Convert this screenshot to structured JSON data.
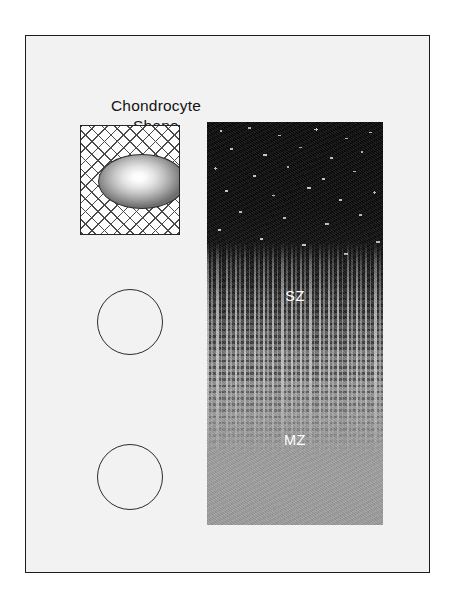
{
  "figure": {
    "columns": {
      "left_title_line1": "Chondrocyte",
      "left_title_line2": "Shape",
      "right_title": "Control"
    },
    "chondrocyte_shapes": [
      {
        "name": "superficial-flattened-cell",
        "geometry": "ellipse",
        "matrix_background": "cross-hatch",
        "fill": "radial-gradient-white-to-gray"
      },
      {
        "name": "middle-zone-round-cell",
        "geometry": "sphere",
        "matrix_background": "none",
        "fill": "radial-gradient-white-to-gray"
      },
      {
        "name": "deep-zone-round-cell",
        "geometry": "sphere",
        "matrix_background": "none",
        "fill": "radial-gradient-white-to-gray"
      }
    ],
    "histology_panel": {
      "title": "Control",
      "zones": [
        {
          "abbr": "SZ",
          "full_name": "Superficial Zone",
          "tone": "#070707"
        },
        {
          "abbr": "MZ",
          "full_name": "Middle Zone",
          "tone": "#7b7b7b"
        },
        {
          "abbr": "DZ",
          "full_name": "Deep Zone",
          "tone": "#9d9d9d"
        }
      ]
    },
    "colors": {
      "panel_background": "#f2f2f2",
      "page_background": "#ffffff",
      "frame_border": "#1c1c1c",
      "label_text": "#ffffff",
      "title_text": "#141414"
    }
  }
}
